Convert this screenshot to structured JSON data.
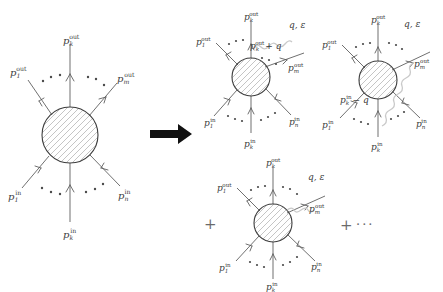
{
  "figure": {
    "type": "feynman-diagram",
    "colors": {
      "line": "#565656",
      "blob_outline": "#3d3d3d",
      "hatch": "#8b8b8b",
      "photon": "#c9c9c9",
      "label": "#3b3b3b",
      "operator": "#6a6a6a",
      "big_arrow": "#111111",
      "background": "#ffffff"
    },
    "operators": {
      "implies": "⟶",
      "plus": "+",
      "ellipsis": "···"
    },
    "labels": {
      "p_out_1": {
        "base": "p",
        "sub": "1",
        "sup": "out"
      },
      "p_out_k": {
        "base": "p",
        "sub": "k",
        "sup": "out"
      },
      "p_out_m": {
        "base": "p",
        "sub": "m",
        "sup": "out"
      },
      "p_in_1": {
        "base": "p",
        "sub": "1",
        "sup": "in"
      },
      "p_in_k": {
        "base": "p",
        "sub": "k",
        "sup": "in"
      },
      "p_in_n": {
        "base": "p",
        "sub": "n",
        "sup": "in"
      },
      "p_out_k_plus_q": {
        "base": "p",
        "sub": "k",
        "sup": "out",
        "suffix": "+ q"
      },
      "p_in_k_minus_q": {
        "base": "p",
        "sub": "k",
        "sup": "in",
        "suffix": "− q"
      },
      "photon": "q, ε"
    }
  },
  "panels": [
    {
      "id": "hard-amplitude",
      "name": "hard-scattering-blob",
      "outgoing": [
        "p_out_1",
        "p_out_k",
        "p_out_m"
      ],
      "incoming": [
        "p_in_1",
        "p_in_k",
        "p_in_n"
      ],
      "photon_attachment": "none"
    },
    {
      "id": "emission-from-outgoing-leg",
      "name": "photon-from-outgoing-leg",
      "outgoing": [
        "p_out_1",
        "p_out_k",
        "p_out_m"
      ],
      "incoming": [
        "p_in_1",
        "p_in_k",
        "p_in_n"
      ],
      "photon_attachment": "outgoing-leg-k",
      "internal_label": "p_out_k_plus_q",
      "photon_label": "q, ε"
    },
    {
      "id": "emission-from-incoming-leg",
      "name": "photon-from-incoming-leg",
      "outgoing": [
        "p_out_1",
        "p_out_k",
        "p_out_m"
      ],
      "incoming": [
        "p_in_1",
        "p_in_k",
        "p_in_n"
      ],
      "photon_attachment": "incoming-leg-k",
      "internal_label": "p_in_k_minus_q",
      "photon_label": "q, ε"
    },
    {
      "id": "emission-from-blob",
      "name": "photon-from-internal-blob",
      "outgoing": [
        "p_out_1",
        "p_out_k",
        "p_out_m"
      ],
      "incoming": [
        "p_in_1",
        "p_in_k",
        "p_in_n"
      ],
      "photon_attachment": "blob",
      "photon_label": "q, ε"
    }
  ],
  "text": {
    "implies_arrow": "⟶",
    "plus_left": "+",
    "plus_right": "+",
    "ellipsis": "···",
    "q_eps_mid": "q, ε",
    "q_eps_right": "q, ε",
    "q_eps_bottom": "q, ε",
    "p_out_k_plus_q_text": "+ q",
    "p_in_k_minus_q_text": "− q",
    "p_base": "p",
    "sup_out": "out",
    "sup_in": "in",
    "sub_1": "1",
    "sub_k": "k",
    "sub_m": "m",
    "sub_n": "n"
  }
}
